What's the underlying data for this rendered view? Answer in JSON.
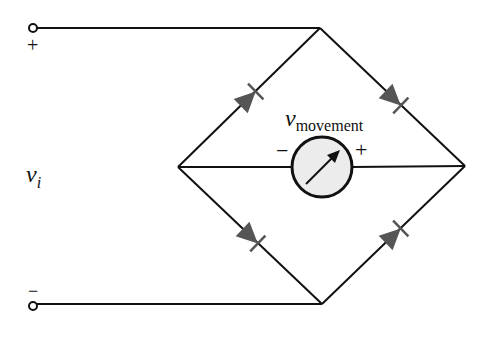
{
  "diagram": {
    "type": "full-wave bridge rectifier meter circuit",
    "input": {
      "label_var": "v",
      "label_sub": "i",
      "positive_terminal": "+",
      "negative_terminal": "−"
    },
    "meter": {
      "label_var": "v",
      "label_sub": "movement",
      "minus": "−",
      "plus": "+",
      "fill": "#ececec"
    },
    "diodes": [
      {
        "id": "D1",
        "position": "upper-left",
        "direction": "toward top node"
      },
      {
        "id": "D2",
        "position": "upper-right",
        "direction": "toward right node"
      },
      {
        "id": "D3",
        "position": "lower-left",
        "direction": "toward bottom node"
      },
      {
        "id": "D4",
        "position": "lower-right",
        "direction": "toward right node"
      }
    ],
    "colors": {
      "wire": "#111111",
      "diode": "#555555"
    }
  }
}
